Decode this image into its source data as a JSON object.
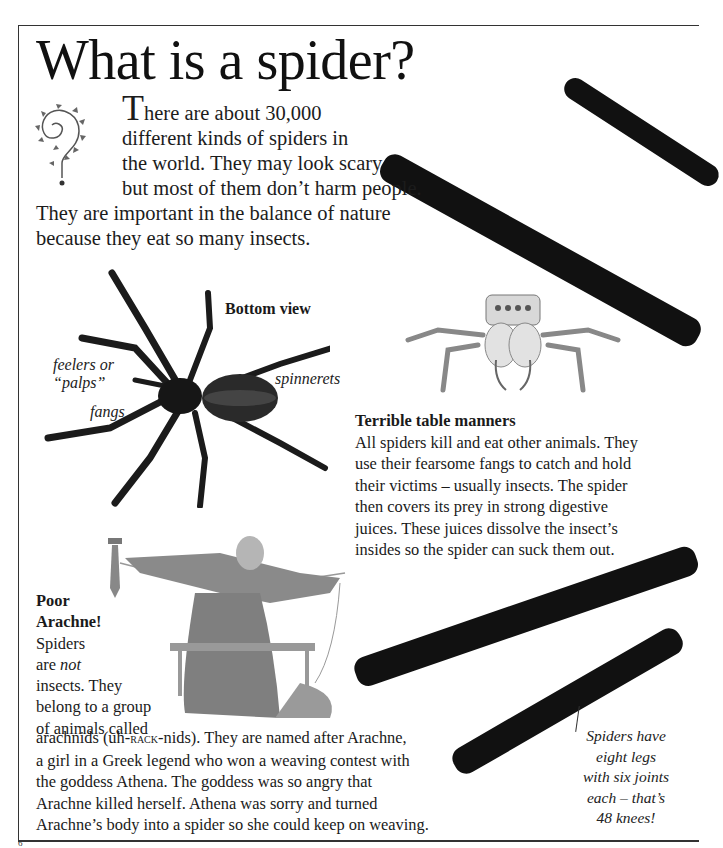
{
  "page": {
    "title": "What is a spider?",
    "page_number": "6"
  },
  "intro": {
    "dropcap": "T",
    "lines": [
      "here are about 30,000",
      "different kinds of spiders in",
      "the world. They may look scary",
      "but most of them don’t harm people.",
      "They are important in the balance of nature",
      "because they eat so many insects."
    ],
    "ornament_icon": "vine-question-mark-ornament"
  },
  "bottom_view": {
    "caption": "Bottom view",
    "labels": {
      "palps": [
        "feelers or",
        "“palps”"
      ],
      "fangs": "fangs",
      "spinnerets": "spinnerets"
    }
  },
  "table_manners": {
    "heading": "Terrible table manners",
    "lines": [
      "All spiders kill and eat other animals. They",
      "use their fearsome fangs to catch and hold",
      "their victims – usually insects. The spider",
      "then covers its prey in strong digestive",
      "juices. These juices dissolve the insect’s",
      "insides so the spider can suck them out."
    ]
  },
  "arachne": {
    "heading_lines": [
      "Poor",
      "Arachne!"
    ],
    "wrap_lines": [
      "Spiders",
      "are ",
      "not",
      "insects. They",
      "belong to a group",
      "of animals called"
    ],
    "cont_lines": {
      "l1_pre": "arachnids (uh-",
      "l1_sc": "rack",
      "l1_post": "-nids). They are named after Arachne,",
      "l2": "a girl in a Greek legend who won a weaving contest with",
      "l3": "the goddess Athena. The goddess was so angry that",
      "l4": "Arachne killed herself. Athena was sorry and turned",
      "l5": "Arachne’s body into a spider so she could keep on weaving."
    }
  },
  "fact_box": {
    "lines": [
      "Spiders have",
      "eight legs",
      "with six joints",
      "each – that’s",
      "48 knees!"
    ]
  },
  "colors": {
    "text": "#1a1a1a",
    "leg": "#111111",
    "frame": "#333333"
  }
}
